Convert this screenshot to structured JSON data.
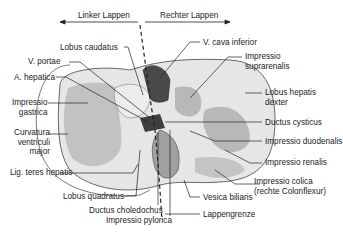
{
  "header": {
    "left_lobe": "Linker Lappen",
    "right_lobe": "Rechter Lappen"
  },
  "labels": {
    "lobus_caudatus": "Lobus caudatus",
    "v_portae": "V. portae",
    "a_hepatica": "A. hepatica",
    "impressio_gastrica_1": "Impressio",
    "impressio_gastrica_2": "gastrica",
    "curvatura_1": "Curvatura",
    "curvatura_2": "ventriculi",
    "curvatura_3": "major",
    "lig_teres": "Lig. teres hepatis",
    "lobus_quadratus": "Lobus quadratus",
    "ductus_choledochus": "Ductus choledochus",
    "impressio_pylorica": "Impressio pylorica",
    "v_cava": "V. cava inferior",
    "impressio_suprarenalis_1": "Impressio",
    "impressio_suprarenalis_2": "suprarenalis",
    "lobus_dexter_1": "Lobus hepatis",
    "lobus_dexter_2": "dexter",
    "ductus_cysticus": "Ductus cysticus",
    "impressio_duodenalis": "Impressio duodenalis",
    "impressio_renalis": "Impressio renalis",
    "impressio_colica_1": "Impressio colica",
    "impressio_colica_2": "(rechte Colonflexur)",
    "vesica_biliaris": "Vesica biliaris",
    "lappengrenze": "Lappengrenze"
  },
  "colors": {
    "liver_light": "#e6e6e6",
    "impression_gray": "#b8b8b8",
    "vessel_dark": "#4a4a4a",
    "gallbladder": "#a0a0a0",
    "line": "#222222"
  }
}
